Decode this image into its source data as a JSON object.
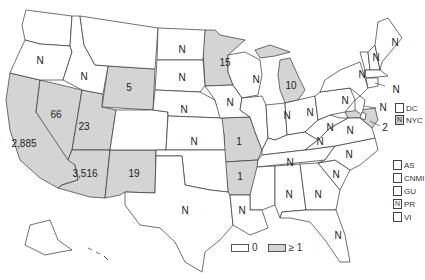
{
  "colors": {
    "zero": "#ffffff",
    "positive": "#d4d4d4",
    "border": "#333333"
  },
  "legend": {
    "zero_label": "0",
    "positive_label": "≥ 1"
  },
  "states": {
    "WA": "",
    "OR": "N",
    "CA": "2,885",
    "NV": "66",
    "ID": "N",
    "MT": "",
    "WY": "5",
    "UT": "23",
    "AZ": "3,516",
    "CO": "",
    "NM": "19",
    "ND": "N",
    "SD": "N",
    "NE": "N",
    "KS": "N",
    "OK": "",
    "TX": "N",
    "MN": "15",
    "IA": "N",
    "MO": "1",
    "AR": "1",
    "LA": "N",
    "WI": "N",
    "IL": "",
    "MI": "10",
    "IN": "N",
    "OH": "N",
    "KY": "N",
    "TN": "N",
    "MS": "",
    "AL": "N",
    "GA": "N",
    "FL": "N",
    "SC": "N",
    "NC": "N",
    "VA": "N",
    "WV": "N",
    "PA": "N",
    "NY": "N",
    "VT": "N",
    "NH": "",
    "ME": "N",
    "MA": "",
    "CT": "N",
    "NJ": "N",
    "MD": "2",
    "DE": "",
    "AK": "",
    "HI": ""
  },
  "side_labels": {
    "ct_n": "N",
    "nj_n": "N",
    "md_value": "2"
  },
  "territories_top": [
    {
      "code": "DC",
      "value": ""
    },
    {
      "code": "NYC",
      "value": "N"
    }
  ],
  "territories_bottom": [
    {
      "code": "AS",
      "value": ""
    },
    {
      "code": "CNMI",
      "value": ""
    },
    {
      "code": "GU",
      "value": ""
    },
    {
      "code": "PR",
      "value": "N"
    },
    {
      "code": "VI",
      "value": ""
    }
  ]
}
